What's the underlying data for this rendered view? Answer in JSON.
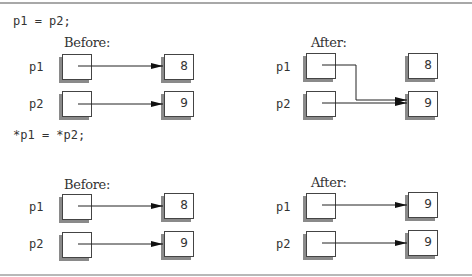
{
  "statements": [
    "p1 = p2;",
    "*p1 = *p2;"
  ],
  "panels": [
    {
      "title": "Before:",
      "pointers": [
        {
          "name": "p1"
        },
        {
          "name": "p2"
        }
      ],
      "targets": [
        "8",
        "9"
      ]
    },
    {
      "title": "After:",
      "pointers": [
        {
          "name": "p1"
        },
        {
          "name": "p2"
        }
      ],
      "targets": [
        "8",
        "9"
      ]
    },
    {
      "title": "Before:",
      "pointers": [
        {
          "name": "p1"
        },
        {
          "name": "p2"
        }
      ],
      "targets": [
        "8",
        "9"
      ]
    },
    {
      "title": "After:",
      "pointers": [
        {
          "name": "p1"
        },
        {
          "name": "p2"
        }
      ],
      "targets": [
        "9",
        "9"
      ]
    }
  ]
}
